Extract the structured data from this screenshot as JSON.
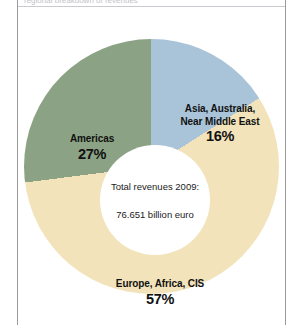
{
  "figure": {
    "clipped_caption": "regional breakdown of revenues",
    "center": {
      "line1": "Total revenues 2009:",
      "line2": "76.651 billion euro"
    }
  },
  "chart_data": {
    "type": "pie",
    "variant": "donut",
    "title": "",
    "subtitle": "",
    "xlabel": "",
    "ylabel": "",
    "total_label": "Total revenues 2009:",
    "total_value_label": "76.651 billion euro",
    "total_value": 76.651,
    "units": "billion euro",
    "year": 2009,
    "legend": "inline-labels",
    "grid": false,
    "categories": [
      "Europe, Africa, CIS",
      "Americas",
      "Asia, Australia, Near Middle East"
    ],
    "values": [
      57,
      27,
      16
    ],
    "value_labels": [
      "57%",
      "27%",
      "16%"
    ],
    "colors": [
      "#f2e3bb",
      "#8ba384",
      "#a9c3d8"
    ],
    "slices": [
      {
        "name": "Europe, Africa, CIS",
        "label_line1": "Europe, Africa, CIS",
        "value": 57,
        "value_label": "57%",
        "color": "#f2e3bb"
      },
      {
        "name": "Americas",
        "label_line1": "Americas",
        "value": 27,
        "value_label": "27%",
        "color": "#8ba384"
      },
      {
        "name": "Asia, Australia, Near Middle East",
        "label_line1": "Asia, Australia,",
        "label_line2": "Near Middle East",
        "value": 16,
        "value_label": "16%",
        "color": "#a9c3d8"
      }
    ]
  }
}
